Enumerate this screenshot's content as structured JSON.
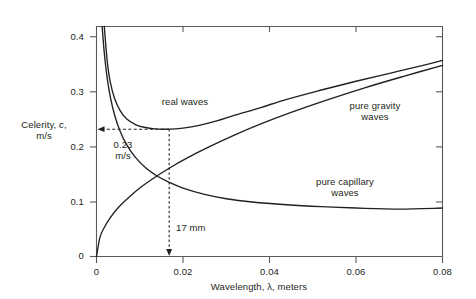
{
  "chart_data": {
    "type": "line",
    "title": "",
    "xlabel": "Wavelength, λ, meters",
    "ylabel_line1": "Celerity, c,",
    "ylabel_line2": "m/s",
    "ylabel_italic_symbol": "c",
    "xlim": [
      0,
      0.08
    ],
    "ylim": [
      0,
      0.42
    ],
    "xticks": [
      0,
      0.02,
      0.04,
      0.06,
      0.08
    ],
    "xtick_labels": [
      "0",
      "0.02",
      "0.04",
      "0.06",
      "0.08"
    ],
    "yticks": [
      0,
      0.1,
      0.2,
      0.3,
      0.4
    ],
    "ytick_labels": [
      "0",
      "0.1",
      "0.2",
      "0.3",
      "0.4"
    ],
    "grid": false,
    "legend_position": "inline-annotations",
    "series": [
      {
        "name": "real waves",
        "label": "real waves",
        "points": [
          [
            0.0018,
            0.42
          ],
          [
            0.0025,
            0.355
          ],
          [
            0.0032,
            0.318
          ],
          [
            0.0042,
            0.288
          ],
          [
            0.0055,
            0.266
          ],
          [
            0.007,
            0.251
          ],
          [
            0.009,
            0.241
          ],
          [
            0.011,
            0.236
          ],
          [
            0.0135,
            0.233
          ],
          [
            0.0168,
            0.2325
          ],
          [
            0.02,
            0.2345
          ],
          [
            0.024,
            0.24
          ],
          [
            0.028,
            0.248
          ],
          [
            0.032,
            0.258
          ],
          [
            0.038,
            0.272
          ],
          [
            0.044,
            0.287
          ],
          [
            0.052,
            0.304
          ],
          [
            0.06,
            0.32
          ],
          [
            0.068,
            0.335
          ],
          [
            0.076,
            0.35
          ],
          [
            0.08,
            0.358
          ]
        ]
      },
      {
        "name": "pure capillary waves",
        "label": "pure capillary\nwaves",
        "label_line1": "pure capillary",
        "label_line2": "waves",
        "points": [
          [
            0.0013,
            0.42
          ],
          [
            0.0018,
            0.372
          ],
          [
            0.0024,
            0.33
          ],
          [
            0.0032,
            0.291
          ],
          [
            0.0042,
            0.258
          ],
          [
            0.0055,
            0.228
          ],
          [
            0.007,
            0.204
          ],
          [
            0.009,
            0.181
          ],
          [
            0.0115,
            0.161
          ],
          [
            0.014,
            0.147
          ],
          [
            0.0168,
            0.1355
          ],
          [
            0.02,
            0.125
          ],
          [
            0.025,
            0.1135
          ],
          [
            0.03,
            0.1055
          ],
          [
            0.036,
            0.0995
          ],
          [
            0.044,
            0.0945
          ],
          [
            0.052,
            0.091
          ],
          [
            0.06,
            0.0885
          ],
          [
            0.07,
            0.0865
          ],
          [
            0.08,
            0.0885
          ]
        ]
      },
      {
        "name": "pure gravity waves",
        "label": "pure gravity\nwaves",
        "label_line1": "pure gravity",
        "label_line2": "waves",
        "points": [
          [
            0.0,
            0.0
          ],
          [
            0.0008,
            0.035
          ],
          [
            0.0018,
            0.053
          ],
          [
            0.0032,
            0.071
          ],
          [
            0.005,
            0.089
          ],
          [
            0.0072,
            0.106
          ],
          [
            0.01,
            0.125
          ],
          [
            0.013,
            0.142
          ],
          [
            0.0168,
            0.1612
          ],
          [
            0.021,
            0.18
          ],
          [
            0.026,
            0.2
          ],
          [
            0.032,
            0.222
          ],
          [
            0.038,
            0.242
          ],
          [
            0.045,
            0.263
          ],
          [
            0.053,
            0.285
          ],
          [
            0.062,
            0.308
          ],
          [
            0.071,
            0.329
          ],
          [
            0.08,
            0.349
          ]
        ]
      }
    ],
    "annotations": [
      {
        "name": "minimum-celerity",
        "text_line1": "0.23",
        "text_line2": "m/s",
        "value": 0.2325,
        "style": "dashed-leader-with-arrow-to-y-axis",
        "from": [
          0.0168,
          0.2325
        ],
        "to": [
          0.0,
          0.2325
        ]
      },
      {
        "name": "minimum-wavelength",
        "text": "17 mm",
        "value": 0.017,
        "style": "dashed-leader-with-arrow-to-x-axis",
        "from": [
          0.0168,
          0.2325
        ],
        "to": [
          0.0168,
          0.0
        ]
      }
    ],
    "colors": {
      "curve": "#231f20",
      "axis": "#58595b",
      "text": "#231f20",
      "background": "#ffffff"
    }
  }
}
